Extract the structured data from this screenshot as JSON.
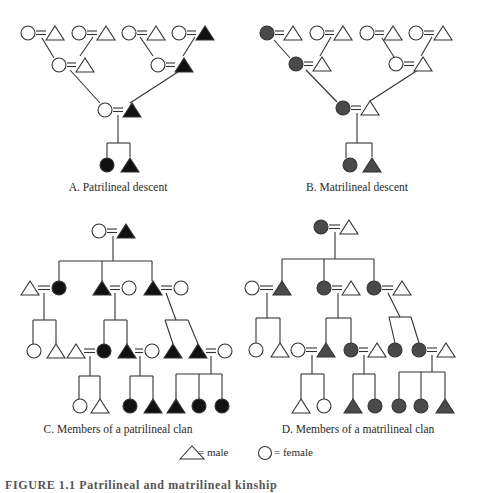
{
  "colors": {
    "patrilineal_fill": "#111111",
    "matrilineal_fill": "#4a4a4a",
    "stroke": "#333333",
    "open_fill": "#ffffff"
  },
  "panels": [
    {
      "id": "A",
      "caption": "A. Patrilineal descent",
      "caption_pos": [
        118,
        181
      ],
      "fill_color_key": "patrilineal_fill",
      "nodes": [
        {
          "shape": "circle",
          "x": 28,
          "y": 33,
          "filled": false
        },
        {
          "shape": "triangle",
          "x": 55,
          "y": 33,
          "filled": false
        },
        {
          "shape": "circle",
          "x": 79,
          "y": 33,
          "filled": false
        },
        {
          "shape": "triangle",
          "x": 106,
          "y": 33,
          "filled": false
        },
        {
          "shape": "circle",
          "x": 129,
          "y": 33,
          "filled": false
        },
        {
          "shape": "triangle",
          "x": 156,
          "y": 33,
          "filled": false
        },
        {
          "shape": "circle",
          "x": 179,
          "y": 33,
          "filled": false
        },
        {
          "shape": "triangle",
          "x": 205,
          "y": 33,
          "filled": true
        },
        {
          "shape": "circle",
          "x": 59,
          "y": 65,
          "filled": false
        },
        {
          "shape": "triangle",
          "x": 85,
          "y": 65,
          "filled": false
        },
        {
          "shape": "circle",
          "x": 158,
          "y": 65,
          "filled": false
        },
        {
          "shape": "triangle",
          "x": 184,
          "y": 65,
          "filled": true
        },
        {
          "shape": "circle",
          "x": 105,
          "y": 110,
          "filled": false
        },
        {
          "shape": "triangle",
          "x": 132,
          "y": 110,
          "filled": true
        },
        {
          "shape": "circle",
          "x": 107,
          "y": 165,
          "filled": true
        },
        {
          "shape": "triangle",
          "x": 130,
          "y": 165,
          "filled": true
        }
      ],
      "marriages": [
        [
          0,
          1
        ],
        [
          2,
          3
        ],
        [
          4,
          5
        ],
        [
          6,
          7
        ],
        [
          8,
          9
        ],
        [
          10,
          11
        ],
        [
          12,
          13
        ]
      ],
      "lines": [
        [
          42,
          38,
          54,
          58
        ],
        [
          93,
          37,
          80,
          56
        ],
        [
          140,
          37,
          153,
          56
        ],
        [
          195,
          37,
          183,
          56
        ],
        [
          70,
          70,
          100,
          103
        ],
        [
          181,
          70,
          130,
          103
        ],
        [
          118,
          115,
          118,
          143
        ],
        [
          107,
          143,
          130,
          143
        ],
        [
          107,
          143,
          107,
          158
        ],
        [
          130,
          143,
          130,
          157
        ]
      ]
    },
    {
      "id": "B",
      "caption": "B. Matrilineal descent",
      "caption_pos": [
        357,
        181
      ],
      "fill_color_key": "matrilineal_fill",
      "nodes": [
        {
          "shape": "circle",
          "x": 267,
          "y": 33,
          "filled": true
        },
        {
          "shape": "triangle",
          "x": 293,
          "y": 33,
          "filled": false
        },
        {
          "shape": "circle",
          "x": 317,
          "y": 33,
          "filled": false
        },
        {
          "shape": "triangle",
          "x": 343,
          "y": 33,
          "filled": false
        },
        {
          "shape": "circle",
          "x": 367,
          "y": 33,
          "filled": false
        },
        {
          "shape": "triangle",
          "x": 393,
          "y": 33,
          "filled": false
        },
        {
          "shape": "circle",
          "x": 416,
          "y": 33,
          "filled": false
        },
        {
          "shape": "triangle",
          "x": 443,
          "y": 33,
          "filled": false
        },
        {
          "shape": "circle",
          "x": 296,
          "y": 64,
          "filled": true
        },
        {
          "shape": "triangle",
          "x": 322,
          "y": 64,
          "filled": false
        },
        {
          "shape": "circle",
          "x": 396,
          "y": 64,
          "filled": true,
          "open_override": true
        },
        {
          "shape": "triangle",
          "x": 423,
          "y": 64,
          "filled": false
        },
        {
          "shape": "circle",
          "x": 343,
          "y": 108,
          "filled": true
        },
        {
          "shape": "triangle",
          "x": 370,
          "y": 108,
          "filled": false
        },
        {
          "shape": "circle",
          "x": 350,
          "y": 165,
          "filled": true
        },
        {
          "shape": "triangle",
          "x": 372,
          "y": 165,
          "filled": true
        }
      ],
      "marriages": [
        [
          0,
          1
        ],
        [
          2,
          3
        ],
        [
          4,
          5
        ],
        [
          6,
          7
        ],
        [
          8,
          9
        ],
        [
          10,
          11
        ],
        [
          12,
          13
        ]
      ],
      "lines": [
        [
          274,
          40,
          290,
          58
        ],
        [
          331,
          37,
          320,
          56
        ],
        [
          382,
          38,
          394,
          57
        ],
        [
          432,
          37,
          421,
          56
        ],
        [
          306,
          70,
          337,
          102
        ],
        [
          418,
          70,
          370,
          101
        ],
        [
          357,
          113,
          357,
          143
        ],
        [
          346,
          143,
          372,
          143
        ],
        [
          346,
          143,
          346,
          158
        ],
        [
          372,
          143,
          372,
          157
        ]
      ]
    },
    {
      "id": "C",
      "caption": "C. Members of a patrilineal clan",
      "caption_pos": [
        118,
        423
      ],
      "fill_color_key": "patrilineal_fill",
      "nodes": [
        {
          "shape": "circle",
          "x": 99,
          "y": 231,
          "filled": false
        },
        {
          "shape": "triangle",
          "x": 126,
          "y": 231,
          "filled": true
        },
        {
          "shape": "triangle",
          "x": 30,
          "y": 288,
          "filled": false
        },
        {
          "shape": "circle",
          "x": 59,
          "y": 288,
          "filled": true
        },
        {
          "shape": "triangle",
          "x": 102,
          "y": 288,
          "filled": true
        },
        {
          "shape": "circle",
          "x": 129,
          "y": 288,
          "filled": false
        },
        {
          "shape": "triangle",
          "x": 153,
          "y": 288,
          "filled": true
        },
        {
          "shape": "circle",
          "x": 181,
          "y": 288,
          "filled": false
        },
        {
          "shape": "circle",
          "x": 34,
          "y": 351,
          "filled": false
        },
        {
          "shape": "triangle",
          "x": 56,
          "y": 351,
          "filled": false
        },
        {
          "shape": "triangle",
          "x": 76,
          "y": 351,
          "filled": false
        },
        {
          "shape": "circle",
          "x": 104,
          "y": 351,
          "filled": true
        },
        {
          "shape": "triangle",
          "x": 127,
          "y": 351,
          "filled": true
        },
        {
          "shape": "circle",
          "x": 152,
          "y": 351,
          "filled": false
        },
        {
          "shape": "triangle",
          "x": 173,
          "y": 351,
          "filled": true
        },
        {
          "shape": "triangle",
          "x": 198,
          "y": 351,
          "filled": true
        },
        {
          "shape": "circle",
          "x": 225,
          "y": 351,
          "filled": false
        },
        {
          "shape": "circle",
          "x": 80,
          "y": 406,
          "filled": false
        },
        {
          "shape": "triangle",
          "x": 100,
          "y": 406,
          "filled": false
        },
        {
          "shape": "circle",
          "x": 130,
          "y": 406,
          "filled": true
        },
        {
          "shape": "triangle",
          "x": 153,
          "y": 406,
          "filled": true
        },
        {
          "shape": "triangle",
          "x": 176,
          "y": 406,
          "filled": true
        },
        {
          "shape": "circle",
          "x": 199,
          "y": 406,
          "filled": true
        },
        {
          "shape": "circle",
          "x": 222,
          "y": 406,
          "filled": true
        }
      ],
      "marriages": [
        [
          0,
          1
        ],
        [
          2,
          3
        ],
        [
          4,
          5
        ],
        [
          6,
          7
        ],
        [
          10,
          11
        ],
        [
          12,
          13
        ],
        [
          15,
          16
        ]
      ],
      "lines": [
        [
          113,
          236,
          113,
          261
        ],
        [
          59,
          261,
          152,
          261
        ],
        [
          59,
          261,
          59,
          281
        ],
        [
          102,
          261,
          102,
          281
        ],
        [
          152,
          261,
          152,
          281
        ],
        [
          44,
          293,
          44,
          320
        ],
        [
          33,
          320,
          56,
          320
        ],
        [
          33,
          320,
          33,
          344
        ],
        [
          56,
          320,
          56,
          344
        ],
        [
          115,
          293,
          115,
          320
        ],
        [
          104,
          320,
          127,
          320
        ],
        [
          104,
          320,
          104,
          344
        ],
        [
          127,
          320,
          127,
          344
        ],
        [
          166,
          293,
          176,
          320
        ],
        [
          165,
          320,
          188,
          320
        ],
        [
          165,
          320,
          173,
          344
        ],
        [
          188,
          320,
          198,
          344
        ],
        [
          90,
          356,
          90,
          376
        ],
        [
          79,
          376,
          100,
          376
        ],
        [
          79,
          376,
          79,
          399
        ],
        [
          100,
          376,
          100,
          399
        ],
        [
          140,
          356,
          140,
          376
        ],
        [
          130,
          376,
          153,
          376
        ],
        [
          130,
          376,
          130,
          399
        ],
        [
          153,
          376,
          153,
          399
        ],
        [
          211,
          356,
          211,
          374
        ],
        [
          176,
          374,
          222,
          374
        ],
        [
          176,
          374,
          176,
          399
        ],
        [
          199,
          374,
          199,
          399
        ],
        [
          222,
          374,
          222,
          399
        ]
      ]
    },
    {
      "id": "D",
      "caption": "D. Members of a matrilineal clan",
      "caption_pos": [
        358,
        423
      ],
      "fill_color_key": "matrilineal_fill",
      "nodes": [
        {
          "shape": "circle",
          "x": 321,
          "y": 227,
          "filled": true
        },
        {
          "shape": "triangle",
          "x": 349,
          "y": 227,
          "filled": false
        },
        {
          "shape": "circle",
          "x": 252,
          "y": 288,
          "filled": false
        },
        {
          "shape": "triangle",
          "x": 282,
          "y": 288,
          "filled": true
        },
        {
          "shape": "circle",
          "x": 324,
          "y": 288,
          "filled": true
        },
        {
          "shape": "triangle",
          "x": 351,
          "y": 288,
          "filled": false
        },
        {
          "shape": "circle",
          "x": 374,
          "y": 288,
          "filled": true
        },
        {
          "shape": "triangle",
          "x": 402,
          "y": 288,
          "filled": false
        },
        {
          "shape": "circle",
          "x": 256,
          "y": 350,
          "filled": false
        },
        {
          "shape": "triangle",
          "x": 280,
          "y": 350,
          "filled": false
        },
        {
          "shape": "circle",
          "x": 298,
          "y": 350,
          "filled": false
        },
        {
          "shape": "triangle",
          "x": 326,
          "y": 350,
          "filled": true
        },
        {
          "shape": "circle",
          "x": 351,
          "y": 350,
          "filled": true
        },
        {
          "shape": "triangle",
          "x": 377,
          "y": 350,
          "filled": false
        },
        {
          "shape": "circle",
          "x": 395,
          "y": 350,
          "filled": true
        },
        {
          "shape": "circle",
          "x": 419,
          "y": 350,
          "filled": true
        },
        {
          "shape": "triangle",
          "x": 446,
          "y": 350,
          "filled": false
        },
        {
          "shape": "triangle",
          "x": 301,
          "y": 406,
          "filled": false
        },
        {
          "shape": "circle",
          "x": 324,
          "y": 406,
          "filled": false
        },
        {
          "shape": "triangle",
          "x": 353,
          "y": 406,
          "filled": true
        },
        {
          "shape": "circle",
          "x": 375,
          "y": 406,
          "filled": true
        },
        {
          "shape": "circle",
          "x": 399,
          "y": 406,
          "filled": true
        },
        {
          "shape": "circle",
          "x": 421,
          "y": 406,
          "filled": true
        },
        {
          "shape": "triangle",
          "x": 445,
          "y": 406,
          "filled": true
        }
      ],
      "marriages": [
        [
          0,
          1
        ],
        [
          2,
          3
        ],
        [
          4,
          5
        ],
        [
          6,
          7
        ],
        [
          10,
          11
        ],
        [
          12,
          13
        ],
        [
          15,
          16
        ]
      ],
      "lines": [
        [
          335,
          232,
          335,
          259
        ],
        [
          282,
          259,
          374,
          259
        ],
        [
          282,
          259,
          282,
          281
        ],
        [
          324,
          259,
          324,
          281
        ],
        [
          374,
          259,
          374,
          281
        ],
        [
          267,
          293,
          267,
          318
        ],
        [
          256,
          318,
          280,
          318
        ],
        [
          256,
          318,
          256,
          343
        ],
        [
          280,
          318,
          280,
          343
        ],
        [
          338,
          293,
          338,
          318
        ],
        [
          326,
          318,
          351,
          318
        ],
        [
          326,
          318,
          326,
          343
        ],
        [
          351,
          318,
          351,
          343
        ],
        [
          388,
          293,
          400,
          317
        ],
        [
          389,
          317,
          411,
          317
        ],
        [
          389,
          317,
          395,
          343
        ],
        [
          411,
          317,
          419,
          343
        ],
        [
          312,
          355,
          312,
          374
        ],
        [
          301,
          374,
          324,
          374
        ],
        [
          301,
          374,
          301,
          399
        ],
        [
          324,
          374,
          324,
          399
        ],
        [
          364,
          355,
          364,
          374
        ],
        [
          353,
          374,
          375,
          374
        ],
        [
          353,
          374,
          353,
          399
        ],
        [
          375,
          374,
          375,
          399
        ],
        [
          432,
          355,
          432,
          372
        ],
        [
          399,
          372,
          445,
          372
        ],
        [
          399,
          372,
          399,
          399
        ],
        [
          421,
          372,
          421,
          399
        ],
        [
          445,
          372,
          445,
          399
        ]
      ]
    }
  ],
  "legend": {
    "male_symbol": "triangle",
    "male_label": "= male",
    "female_symbol": "circle",
    "female_label": "= female"
  },
  "figure_caption": "FIGURE 1.1 Patrilineal and matrilineal kinship"
}
